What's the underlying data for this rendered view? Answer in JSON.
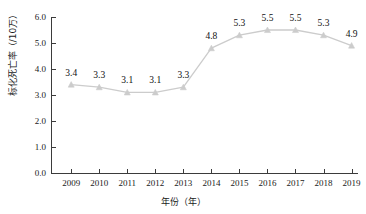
{
  "chart_data": {
    "type": "line",
    "title": "",
    "xlabel": "年份（年）",
    "ylabel": "标化死亡率（/10万）",
    "categories": [
      "2009",
      "2010",
      "2011",
      "2012",
      "2013",
      "2014",
      "2015",
      "2016",
      "2017",
      "2018",
      "2019"
    ],
    "values": [
      3.4,
      3.3,
      3.1,
      3.1,
      3.3,
      4.8,
      5.3,
      5.5,
      5.5,
      5.3,
      4.9
    ],
    "value_labels": [
      "3.4",
      "3.3",
      "3.1",
      "3.1",
      "3.3",
      "4.8",
      "5.3",
      "5.5",
      "5.5",
      "5.3",
      "4.9"
    ],
    "ylim": [
      0.0,
      6.0
    ],
    "ytick_values": [
      0.0,
      1.0,
      2.0,
      3.0,
      4.0,
      5.0,
      6.0
    ],
    "ytick_labels": [
      "0.0",
      "1.0",
      "2.0",
      "3.0",
      "4.0",
      "5.0",
      "6.0"
    ],
    "grid": false,
    "legend": null,
    "marker": "triangle",
    "series_color": "#cccccc",
    "axis_color": "#3b3b3b",
    "label_color": "#111111",
    "background": "#ffffff"
  }
}
